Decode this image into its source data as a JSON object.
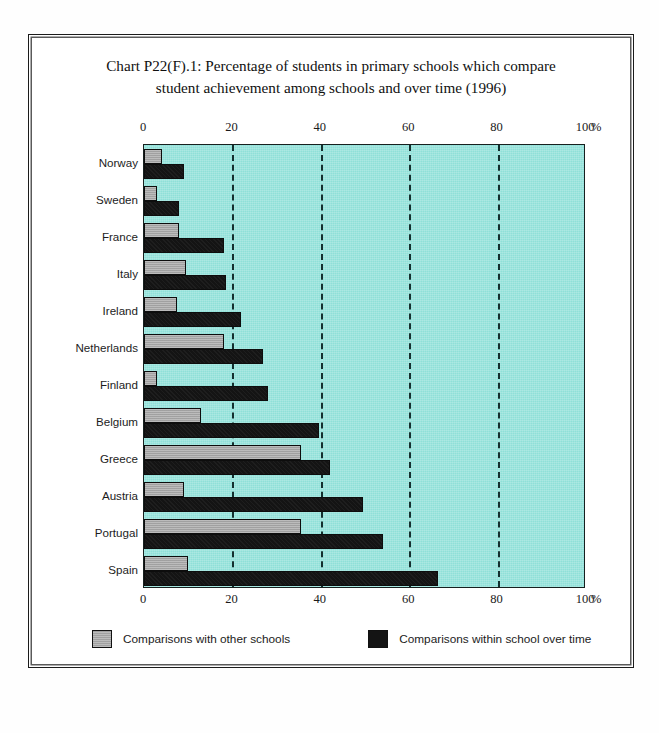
{
  "figure": {
    "title_line1": "Chart P22(F).1: Percentage of students in primary schools which compare",
    "title_line2": "student achievement among schools and over time (1996)",
    "unit_label": "%",
    "background_color": "#8fe0d8",
    "series_colors": {
      "comparisons_other_schools": "#a9a9a9",
      "comparisons_over_time": "#141414"
    }
  },
  "legend": {
    "items": [
      {
        "label": "Comparisons with other schools",
        "swatch": "gray-swatch"
      },
      {
        "label": "Comparisons within school over time",
        "swatch": "black-swatch"
      }
    ]
  },
  "chart_data": {
    "type": "bar",
    "orientation": "horizontal",
    "title": "Chart P22(F).1: Percentage of students in primary schools which compare student achievement among schools and over time (1996)",
    "xlabel": "%",
    "ylabel": "",
    "xlim": [
      0,
      100
    ],
    "xticks": [
      0,
      20,
      40,
      60,
      80,
      100
    ],
    "xtick_labels": [
      "0",
      "20",
      "40",
      "60",
      "80",
      "100"
    ],
    "grid": "vertical-dashed-at-20-40-60-80",
    "axis_positions": [
      "top",
      "bottom"
    ],
    "legend_position": "bottom",
    "categories": [
      "Norway",
      "Sweden",
      "France",
      "Italy",
      "Ireland",
      "Netherlands",
      "Finland",
      "Belgium",
      "Greece",
      "Austria",
      "Portugal",
      "Spain"
    ],
    "series": [
      {
        "name": "Comparisons with other schools",
        "color": "#a9a9a9",
        "values": [
          4,
          3,
          8,
          9.5,
          7.5,
          18,
          3,
          13,
          35.5,
          9,
          35.5,
          10
        ]
      },
      {
        "name": "Comparisons within school over time",
        "color": "#141414",
        "values": [
          9,
          8,
          18,
          18.5,
          22,
          27,
          28,
          39.5,
          42,
          49.5,
          54,
          66.5
        ]
      }
    ]
  }
}
